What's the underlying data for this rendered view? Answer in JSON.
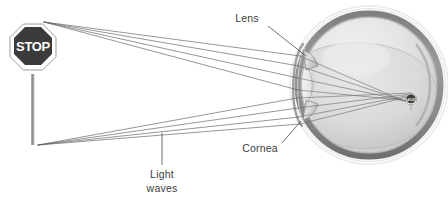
{
  "figure": {
    "background_color": "#ffffff",
    "width": 448,
    "height": 200
  },
  "object": {
    "name": "stop-sign",
    "sign_text": "STOP",
    "sign_fill": "#3b3b3b",
    "sign_border": "#ffffff",
    "sign_outline": "#7a7a7a",
    "post_color": "#9a9a9a",
    "cx": 33,
    "cy": 50,
    "radius": 26
  },
  "retinal_image": {
    "name": "inverted-stop-sign-image",
    "sign_text": "STOP",
    "cx": 411,
    "cy": 99,
    "radius": 6,
    "inverted": true
  },
  "eye": {
    "cx": 369,
    "cy": 85,
    "radius_outer": 79,
    "radius_sclera": 73,
    "radius_inner": 67,
    "halo_color": "#f2f2f2",
    "sclera_color": "#8c8c8c",
    "interior_color": "#e6e6e6",
    "vitreous_color": "#d4d4d4",
    "cornea_color": "#f4f4f4",
    "lens_color": "#cfcfcf"
  },
  "labels": [
    {
      "id": "lens",
      "text": "Lens",
      "x": 247,
      "y": 22,
      "leader_from": [
        268,
        26
      ],
      "leader_to": [
        306,
        56
      ]
    },
    {
      "id": "cornea",
      "text": "Cornea",
      "x": 238,
      "y": 151,
      "leader_from": [
        282,
        144
      ],
      "leader_to": [
        300,
        122
      ]
    },
    {
      "id": "light-waves",
      "line1": "Light",
      "line2": "waves",
      "x": 148,
      "y": 174,
      "leader_from": [
        162,
        133
      ],
      "leader_to": [
        162,
        164
      ]
    }
  ],
  "light_rays": {
    "description": "Light waves travelling from the stop sign, refracting at the cornea and lens, crossing, and forming an inverted image on the retina",
    "stroke_color": "#5c5c5c",
    "top_origin": [
      44,
      22
    ],
    "bottom_origin": [
      38,
      145
    ],
    "cornea_entry_top": [
      300,
      58
    ],
    "cornea_entry_bottom": [
      298,
      112
    ],
    "focus_top": [
      411,
      104
    ],
    "focus_bottom": [
      411,
      94
    ],
    "ray_count": 8
  },
  "legend": {
    "anatomy_terms": [
      "Lens",
      "Cornea",
      "Light waves"
    ]
  }
}
